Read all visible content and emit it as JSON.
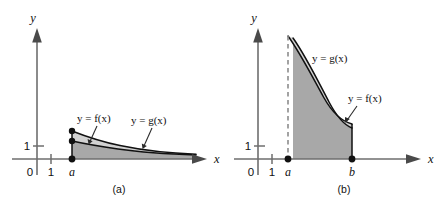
{
  "figure": {
    "panels": [
      {
        "caption": "(a)",
        "axis_x_label": "x",
        "axis_y_label": "y",
        "tick_origin_label": "0",
        "tick_x_one_label": "1",
        "tick_y_one_label": "1",
        "point_a_label": "a",
        "curve_upper_label": "y = g(x)",
        "curve_lower_label": "y = f(x)",
        "description": "Two decaying curves on [a, infinity): g above f, shaded region beneath."
      },
      {
        "caption": "(b)",
        "axis_x_label": "x",
        "axis_y_label": "y",
        "tick_origin_label": "0",
        "tick_x_one_label": "1",
        "tick_y_one_label": "1",
        "point_a_label": "a",
        "point_b_label": "b",
        "curve_upper_label": "y = g(x)",
        "curve_lower_label": "y = f(x)",
        "description": "Two curves with a vertical asymptote at x = a on the interval [a, b], g above f, shaded region beneath."
      }
    ],
    "colors": {
      "region_lower_fill": "#a8a8a8",
      "region_band_fill": "#d2d2d2",
      "curve_stroke": "#111111",
      "axis_stroke": "#6e6e6e",
      "asymptote_stroke": "#8c8c8c",
      "background": "#ffffff"
    }
  }
}
